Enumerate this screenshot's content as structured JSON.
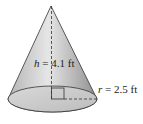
{
  "diagram": {
    "shape": "cone",
    "height_label": {
      "var": "h",
      "eq": " = ",
      "value": "4.1 ft"
    },
    "radius_label": {
      "var": "r",
      "eq": " = ",
      "value": "2.5 ft"
    },
    "colors": {
      "fill_top": "#f2f2f2",
      "fill_mid": "#a8a8a8",
      "base_fill": "#c8c8c8",
      "stroke": "#333333"
    }
  }
}
